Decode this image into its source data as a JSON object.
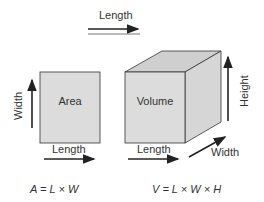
{
  "top_arrow": {
    "label": "Length"
  },
  "area_figure": {
    "shape_label": "Area",
    "side_label": "Width",
    "bottom_label": "Length",
    "formula": "A = L × W"
  },
  "volume_figure": {
    "shape_label": "Volume",
    "bottom_label": "Length",
    "depth_label": "Width",
    "height_label": "Height",
    "formula": "V = L × W × H"
  },
  "colors": {
    "face_front": "#dcdcdc",
    "face_top": "#cfcfcf",
    "face_side": "#d6d6d6",
    "stroke": "#333333"
  }
}
